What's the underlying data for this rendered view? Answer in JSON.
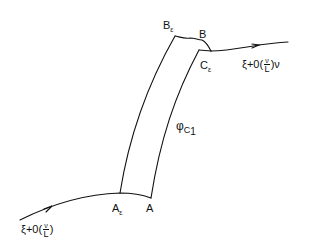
{
  "diagram": {
    "stroke_color": "#111111",
    "background": "#ffffff",
    "labels": {
      "B_eps": {
        "main": "B",
        "sub": "ε"
      },
      "B": {
        "main": "B"
      },
      "C_eps": {
        "main": "C",
        "sub": "ε"
      },
      "A_eps": {
        "main": "A",
        "sub": "ε"
      },
      "A": {
        "main": "A"
      },
      "phi_c1": {
        "main": "φ",
        "sub": "C",
        "subsub": "1"
      },
      "right_expr": {
        "prefix": "ξ+0(",
        "num": "ν",
        "den": "L",
        "suffix": ")ν"
      },
      "left_expr": {
        "prefix": "ξ+0(",
        "num": "ν",
        "den": "L",
        "suffix": ")"
      }
    }
  }
}
